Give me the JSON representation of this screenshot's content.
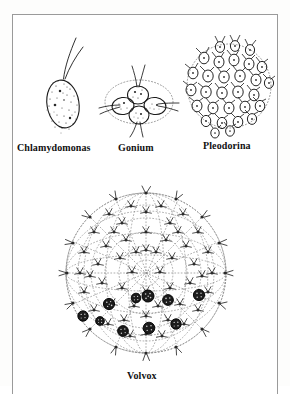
{
  "figure": {
    "kind": "scientific-illustration",
    "style": "black ink line drawing with stippling",
    "background_color": "#ffffff",
    "ink_color": "#1a1a1a",
    "frame_color": "#9a9a9a"
  },
  "organisms": [
    {
      "id": "chlamydomonas",
      "label": "Chlamydomonas",
      "cell_count": 1,
      "description": "single oval unicell with stippled cytoplasm and two apical flagella",
      "flagella_per_cell": 2,
      "has_envelope": false
    },
    {
      "id": "gonium",
      "label": "Gonium",
      "cell_count": 4,
      "description": "flat plate of four stippled cells inside a dotted gelatinous envelope",
      "flagella_per_cell": 2,
      "has_envelope": true,
      "envelope_shape": "ellipse"
    },
    {
      "id": "pleodorina",
      "label": "Pleodorina",
      "cell_count": 30,
      "description": "spheroidal colony of about thirty teardrop cells in a dotted matrix",
      "flagella_per_cell": 2,
      "has_envelope": true,
      "envelope_shape": "circle"
    },
    {
      "id": "volvox",
      "label": "Volvox",
      "cell_count": 160,
      "daughter_colonies": 10,
      "description": "large hollow sphere of many small somatic cells joined by cytoplasmic strands, enclosing dark daughter colonies",
      "flagella_per_cell": 2,
      "has_envelope": true,
      "envelope_shape": "sphere"
    }
  ],
  "labels": {
    "chlamydomonas": "Chlamydomonas",
    "gonium": "Gonium",
    "pleodorina": "Pleodorina",
    "volvox": "Volvox"
  }
}
